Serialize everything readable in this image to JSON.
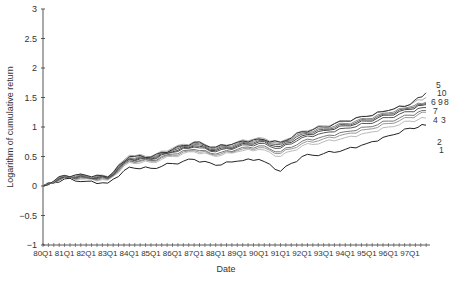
{
  "chart_data": {
    "type": "line",
    "title": "",
    "xlabel": "Date",
    "ylabel": "Logarithm of cumulative return",
    "ylim": [
      -1,
      3
    ],
    "yticks": [
      -1,
      -0.5,
      0,
      0.5,
      1,
      1.5,
      2,
      2.5,
      3
    ],
    "ytick_labels": [
      "−1",
      "−0.5",
      "0",
      "0.5",
      "1",
      "1.5",
      "2",
      "2.5",
      "3"
    ],
    "grid": false,
    "legend": "inline labels at right end of lines",
    "categories": [
      "80Q1",
      "81Q1",
      "82Q1",
      "83Q1",
      "84Q1",
      "85Q1",
      "86Q1",
      "87Q1",
      "88Q1",
      "89Q1",
      "90Q1",
      "91Q1",
      "92Q1",
      "93Q1",
      "94Q1",
      "95Q1",
      "96Q1",
      "97Q1",
      "97Q4"
    ],
    "xtick_labels": [
      "80Q1",
      "81Q1",
      "82Q1",
      "83Q1",
      "84Q1",
      "85Q1",
      "86Q1",
      "87Q1",
      "88Q1",
      "89Q1",
      "90Q1",
      "91Q1",
      "92Q1",
      "93Q1",
      "94Q1",
      "95Q1",
      "96Q1",
      "97Q1"
    ],
    "series": [
      {
        "name": "1",
        "color": "#222222",
        "values": [
          0.0,
          0.12,
          0.08,
          0.05,
          0.32,
          0.3,
          0.38,
          0.45,
          0.35,
          0.42,
          0.45,
          0.25,
          0.5,
          0.55,
          0.62,
          0.72,
          0.85,
          0.98,
          1.03
        ]
      },
      {
        "name": "2",
        "color": "#bbbbbb",
        "values": [
          0.0,
          0.14,
          0.12,
          0.1,
          0.4,
          0.4,
          0.5,
          0.58,
          0.5,
          0.58,
          0.62,
          0.5,
          0.68,
          0.75,
          0.82,
          0.9,
          1.0,
          1.1,
          1.15
        ]
      },
      {
        "name": "3",
        "color": "#999999",
        "values": [
          0.0,
          0.15,
          0.13,
          0.11,
          0.42,
          0.42,
          0.52,
          0.6,
          0.52,
          0.6,
          0.65,
          0.55,
          0.72,
          0.8,
          0.88,
          0.96,
          1.06,
          1.16,
          1.25
        ]
      },
      {
        "name": "4",
        "color": "#777777",
        "values": [
          0.0,
          0.15,
          0.14,
          0.12,
          0.43,
          0.43,
          0.54,
          0.62,
          0.54,
          0.62,
          0.68,
          0.58,
          0.76,
          0.84,
          0.92,
          1.0,
          1.1,
          1.2,
          1.28
        ]
      },
      {
        "name": "7",
        "color": "#555555",
        "values": [
          0.0,
          0.16,
          0.15,
          0.13,
          0.45,
          0.45,
          0.57,
          0.66,
          0.58,
          0.66,
          0.72,
          0.64,
          0.82,
          0.9,
          0.98,
          1.06,
          1.16,
          1.26,
          1.33
        ]
      },
      {
        "name": "6",
        "color": "#444444",
        "values": [
          0.0,
          0.16,
          0.16,
          0.14,
          0.46,
          0.46,
          0.58,
          0.68,
          0.6,
          0.68,
          0.75,
          0.67,
          0.85,
          0.94,
          1.02,
          1.1,
          1.2,
          1.3,
          1.38
        ]
      },
      {
        "name": "9",
        "color": "#666666",
        "values": [
          0.0,
          0.17,
          0.16,
          0.15,
          0.47,
          0.47,
          0.6,
          0.7,
          0.62,
          0.7,
          0.77,
          0.7,
          0.88,
          0.96,
          1.04,
          1.12,
          1.22,
          1.32,
          1.4
        ]
      },
      {
        "name": "8",
        "color": "#888888",
        "values": [
          0.0,
          0.17,
          0.17,
          0.15,
          0.48,
          0.48,
          0.61,
          0.72,
          0.64,
          0.72,
          0.79,
          0.72,
          0.9,
          0.98,
          1.06,
          1.14,
          1.24,
          1.34,
          1.42
        ]
      },
      {
        "name": "10",
        "color": "#aaaaaa",
        "values": [
          0.0,
          0.18,
          0.18,
          0.16,
          0.52,
          0.5,
          0.64,
          0.75,
          0.66,
          0.75,
          0.82,
          0.75,
          0.93,
          1.02,
          1.1,
          1.18,
          1.28,
          1.38,
          1.5
        ]
      },
      {
        "name": "5",
        "color": "#333333",
        "values": [
          0.0,
          0.18,
          0.18,
          0.15,
          0.5,
          0.49,
          0.62,
          0.74,
          0.66,
          0.74,
          0.8,
          0.74,
          0.92,
          1.0,
          1.1,
          1.18,
          1.28,
          1.38,
          1.58
        ]
      }
    ]
  }
}
